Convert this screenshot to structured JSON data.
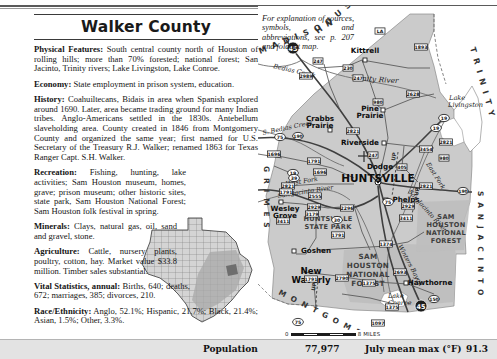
{
  "page": {
    "title": "Walker County"
  },
  "explanation_note": "For explanation of sources, symbols, and abbreviations, see p. 207 and foldout map.",
  "sections": [
    {
      "heading": "Physical Features:",
      "body": " South central county north of Houston of rolling hills; more than 70% forested; national forest; San Jacinto, Trinity rivers; Lake Livingston, Lake Conroe."
    },
    {
      "heading": "Economy:",
      "body": " State employment in prison system, education."
    },
    {
      "heading": "History:",
      "body": " Coahuiltecans, Bidais in area when Spanish explored around 1690. Later, area became trading ground for many Indian tribes. Anglo-Americans settled in the 1830s. Antebellum slaveholding area. County created in 1846 from Montgomery County and organized the same year; first named for U.S. Secretary of the Treasury R.J. Walker; renamed 1863 for Texas Ranger Capt. S.H. Walker."
    },
    {
      "heading": "Recreation:",
      "body": " Fishing, hunting, lake activities; Sam Houston museum, homes, grave; prison museum; other historic sites, state park, Sam Houston National Forest; Sam Houston folk festival in spring."
    },
    {
      "heading": "Minerals:",
      "body": " Clays, natural gas, oil, sand and gravel, stone."
    },
    {
      "heading": "Agriculture:",
      "body": " Cattle, nursery plants, poultry, cotton, hay. Market value $33.8 million. Timber sales substantial."
    },
    {
      "heading": "Vital Statistics, annual:",
      "body": " Births, 640; deaths, 672; marriages, 385; divorces, 210."
    },
    {
      "heading": "Race/Ethnicity:",
      "body": " Anglo, 52.1%; Hispanic, 21.7%; Black, 21.4%; Asian, 1.5%; Other, 3.3%."
    }
  ],
  "stats_bar": {
    "population_label": "Population",
    "population_value": "77,977",
    "july_label": "July mean max (°F)",
    "july_value": "91.3"
  },
  "scale_bar": {
    "left_label": "0",
    "right_label": "8 MILES"
  },
  "map": {
    "neighbor_counties": [
      {
        "name": "HOUSTON",
        "x": 60,
        "y": 28,
        "rotate": -40,
        "size": 8
      },
      {
        "name": "TRINITY",
        "x": 212,
        "y": 42,
        "rotate": 74,
        "size": 8
      },
      {
        "name": "MADISON",
        "x": 2,
        "y": 48,
        "rotate": -22,
        "size": 8
      },
      {
        "name": "GRIMES",
        "x": 6,
        "y": 160,
        "rotate": 90,
        "size": 7.5
      },
      {
        "name": "MONTGOMERY",
        "x": 20,
        "y": 288,
        "rotate": 27,
        "size": 7.5
      },
      {
        "name": "SAN JACINTO",
        "x": 220,
        "y": 185,
        "rotate": 90,
        "size": 7.5
      }
    ],
    "cities": [
      {
        "name": "Kittrell",
        "x": 107,
        "y": 47,
        "size": 7.2,
        "anchor": "middle",
        "dot_x": 107,
        "dot_y": 54,
        "dot": "open"
      },
      {
        "name": "Riverside",
        "x": 102,
        "y": 139,
        "size": 7.2,
        "anchor": "middle",
        "dot_x": 126,
        "dot_y": 137,
        "dot": "open"
      },
      {
        "name": "HUNTSVILLE",
        "x": 120,
        "y": 176,
        "size": 10.5,
        "anchor": "middle",
        "dot_x": null,
        "dot_y": null,
        "dot": "none"
      },
      {
        "name": "Dodge",
        "x": 122,
        "y": 163,
        "size": 7.2,
        "anchor": "middle",
        "dot_x": 145,
        "dot_y": 162,
        "dot": "open"
      },
      {
        "name": "Phelps",
        "x": 148,
        "y": 196,
        "size": 7.2,
        "anchor": "middle",
        "dot_x": 128,
        "dot_y": 194,
        "dot": "open"
      },
      {
        "name": "Hawthorne",
        "x": 172,
        "y": 279,
        "size": 7.2,
        "anchor": "middle",
        "dot_x": 148,
        "dot_y": 277,
        "dot": "open"
      },
      {
        "name": "Goshen",
        "x": 58,
        "y": 247,
        "size": 7.2,
        "anchor": "middle",
        "dot_x": 36,
        "dot_y": 245,
        "dot": "open"
      },
      {
        "name": "Crabbs",
        "x": 62,
        "y": 115,
        "size": 7.2,
        "anchor": "middle",
        "dot_x": null,
        "dot_y": null,
        "dot": "none"
      },
      {
        "name": "Prairie",
        "x": 62,
        "y": 122,
        "size": 7.2,
        "anchor": "middle",
        "dot_x": 72,
        "dot_y": 124,
        "dot": "open"
      },
      {
        "name": "Pine",
        "x": 112,
        "y": 105,
        "size": 7.2,
        "anchor": "middle",
        "dot_x": null,
        "dot_y": null,
        "dot": "none"
      },
      {
        "name": "Prairie",
        "x": 112,
        "y": 112,
        "size": 7.2,
        "anchor": "middle",
        "dot_x": 125,
        "dot_y": 104,
        "dot": "open"
      },
      {
        "name": "Wesley",
        "x": 27,
        "y": 205,
        "size": 7.2,
        "anchor": "middle",
        "dot_x": null,
        "dot_y": null,
        "dot": "none"
      },
      {
        "name": "Grove",
        "x": 27,
        "y": 212,
        "size": 7.2,
        "anchor": "middle",
        "dot_x": 23,
        "dot_y": 196,
        "dot": "open"
      },
      {
        "name": "New",
        "x": 53,
        "y": 268,
        "size": 8.6,
        "anchor": "middle",
        "dot_x": null,
        "dot_y": null,
        "dot": "none"
      },
      {
        "name": "Waverly",
        "x": 53,
        "y": 277,
        "size": 8.6,
        "anchor": "middle",
        "dot_x": null,
        "dot_y": null,
        "dot": "none"
      }
    ],
    "water_labels": [
      {
        "name": "Trinity River",
        "x": 93,
        "y": 74,
        "rotate": 4,
        "size": 7.4
      },
      {
        "name": "Lake",
        "x": 191,
        "y": 94,
        "rotate": 0,
        "size": 6.6
      },
      {
        "name": "Livingston",
        "x": 190,
        "y": 101,
        "rotate": 0,
        "size": 6.6
      },
      {
        "name": "Bedias Creek",
        "x": 15,
        "y": 62,
        "rotate": 13,
        "size": 6.4
      },
      {
        "name": "S. Bedias Creek",
        "x": 5,
        "y": 129,
        "rotate": -12,
        "size": 6.4
      },
      {
        "name": "West Fork",
        "x": 28,
        "y": 180,
        "rotate": -9,
        "size": 6.4
      },
      {
        "name": "San Jacinto River",
        "x": 20,
        "y": 192,
        "rotate": -9,
        "size": 6.4
      },
      {
        "name": "East Fork",
        "x": 168,
        "y": 158,
        "rotate": 58,
        "size": 6.2
      },
      {
        "name": "San Jacinto River",
        "x": 150,
        "y": 186,
        "rotate": 48,
        "size": 6.2
      },
      {
        "name": "Winters Bayou",
        "x": 140,
        "y": 240,
        "rotate": 62,
        "size": 6.2
      },
      {
        "name": "Lake",
        "x": 130,
        "y": 292,
        "rotate": 0,
        "size": 6.4
      },
      {
        "name": "Conroe",
        "x": 130,
        "y": 299,
        "rotate": 0,
        "size": 6.4
      }
    ],
    "park_labels": [
      {
        "name": "SAM",
        "x": 110,
        "y": 253,
        "size": 7.2
      },
      {
        "name": "HOUSTON",
        "x": 110,
        "y": 262,
        "size": 7.2
      },
      {
        "name": "NATIONAL",
        "x": 110,
        "y": 271,
        "size": 7.2
      },
      {
        "name": "FOREST",
        "x": 110,
        "y": 280,
        "size": 7.2
      },
      {
        "name": "SAM",
        "x": 188,
        "y": 213,
        "size": 6.6
      },
      {
        "name": "HOUSTON",
        "x": 188,
        "y": 221,
        "size": 6.6
      },
      {
        "name": "NATIONAL",
        "x": 188,
        "y": 229,
        "size": 6.6
      },
      {
        "name": "FOREST",
        "x": 188,
        "y": 237,
        "size": 6.6
      },
      {
        "name": "HUNTSVILLE",
        "x": 70,
        "y": 215,
        "size": 6.6
      },
      {
        "name": "STATE PARK",
        "x": 70,
        "y": 223,
        "size": 6.6
      }
    ],
    "road_shields": [
      {
        "label": "LA",
        "x": 122,
        "y": 25,
        "type": "rect"
      },
      {
        "label": "1893",
        "x": 163,
        "y": 41,
        "type": "rect"
      },
      {
        "label": "230",
        "x": 90,
        "y": 62,
        "type": "rect"
      },
      {
        "label": "3454",
        "x": 168,
        "y": 143,
        "type": "rect"
      },
      {
        "label": "19",
        "x": 178,
        "y": 122,
        "type": "circle"
      },
      {
        "label": "980",
        "x": 186,
        "y": 152,
        "type": "rect"
      },
      {
        "label": "405",
        "x": 144,
        "y": 161,
        "type": "rect"
      },
      {
        "label": "19",
        "x": 35,
        "y": 167,
        "type": "circle"
      },
      {
        "label": "2821",
        "x": 30,
        "y": 180,
        "type": "rect"
      },
      {
        "label": "190",
        "x": 205,
        "y": 185,
        "type": "circle"
      },
      {
        "label": "2929",
        "x": 56,
        "y": 201,
        "type": "rect"
      },
      {
        "label": "2296",
        "x": 89,
        "y": 202,
        "type": "rect"
      },
      {
        "label": "3411",
        "x": 25,
        "y": 215,
        "type": "rect"
      },
      {
        "label": "2821",
        "x": 168,
        "y": 180,
        "type": "rect"
      },
      {
        "label": "247",
        "x": 60,
        "y": 55,
        "type": "rect"
      },
      {
        "label": "247",
        "x": 100,
        "y": 72,
        "type": "rect"
      },
      {
        "label": "2989",
        "x": 48,
        "y": 70,
        "type": "rect"
      },
      {
        "label": "2628",
        "x": 155,
        "y": 88,
        "type": "rect"
      },
      {
        "label": "980",
        "x": 120,
        "y": 96,
        "type": "rect"
      },
      {
        "label": "19",
        "x": 186,
        "y": 112,
        "type": "circle"
      },
      {
        "label": "2821",
        "x": 188,
        "y": 136,
        "type": "rect"
      },
      {
        "label": "75",
        "x": 22,
        "y": 131,
        "type": "circle"
      },
      {
        "label": "190",
        "x": 40,
        "y": 130,
        "type": "circle"
      },
      {
        "label": "1696",
        "x": 16,
        "y": 148,
        "type": "rect"
      },
      {
        "label": "2821",
        "x": 95,
        "y": 125,
        "type": "rect"
      },
      {
        "label": "247",
        "x": 115,
        "y": 149,
        "type": "rect"
      },
      {
        "label": "1791",
        "x": 56,
        "y": 155,
        "type": "rect"
      },
      {
        "label": "39",
        "x": 36,
        "y": 172,
        "type": "circle"
      },
      {
        "label": "1791",
        "x": 28,
        "y": 186,
        "type": "rect"
      },
      {
        "label": "1696",
        "x": 62,
        "y": 166,
        "type": "rect"
      },
      {
        "label": "2555",
        "x": 57,
        "y": 190,
        "type": "rect"
      },
      {
        "label": "30",
        "x": 79,
        "y": 214,
        "type": "circle"
      },
      {
        "label": "1791",
        "x": 80,
        "y": 229,
        "type": "rect"
      },
      {
        "label": "1374",
        "x": 128,
        "y": 238,
        "type": "rect"
      },
      {
        "label": "1791",
        "x": 53,
        "y": 273,
        "type": "rect"
      },
      {
        "label": "3179",
        "x": 54,
        "y": 208,
        "type": "rect"
      },
      {
        "label": "2693",
        "x": 142,
        "y": 266,
        "type": "rect"
      },
      {
        "label": "2790",
        "x": 84,
        "y": 272,
        "type": "rect"
      },
      {
        "label": "1375",
        "x": 111,
        "y": 277,
        "type": "rect"
      },
      {
        "label": "150",
        "x": 176,
        "y": 293,
        "type": "circle"
      },
      {
        "label": "1097",
        "x": 120,
        "y": 317,
        "type": "rect"
      },
      {
        "label": "75",
        "x": 40,
        "y": 316,
        "type": "circle"
      },
      {
        "label": "1375",
        "x": 134,
        "y": 301,
        "type": "rect"
      },
      {
        "label": "75",
        "x": 130,
        "y": 196,
        "type": "circle"
      },
      {
        "label": "2929",
        "x": 150,
        "y": 200,
        "type": "rect"
      },
      {
        "label": "3411",
        "x": 148,
        "y": 212,
        "type": "rect"
      }
    ],
    "interstate_shields": [
      {
        "label": "45",
        "x": 35,
        "y": 42
      },
      {
        "label": "45",
        "x": 163,
        "y": 300
      }
    ],
    "up_labels": [
      {
        "name": "UP",
        "x": 137,
        "y": 155
      },
      {
        "name": "UP",
        "x": 160,
        "y": 190
      },
      {
        "name": "UP",
        "x": 57,
        "y": 285
      }
    ]
  }
}
